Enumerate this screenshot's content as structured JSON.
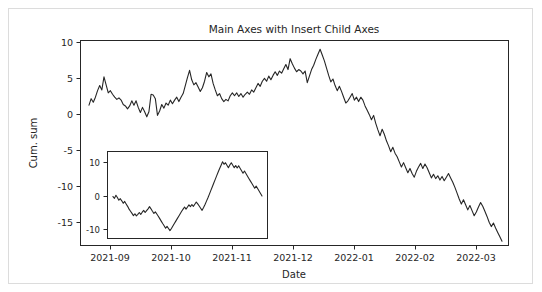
{
  "figure": {
    "background_color": "#ffffff",
    "border_color": "#dcdcdc",
    "line_color": "#262626"
  },
  "chart_data": {
    "type": "line",
    "title": "Main Axes with Insert Child Axes",
    "xlabel": "Date",
    "ylabel": "Cum. sum",
    "grid": false,
    "legend": null,
    "xtick_labels": [
      "2021-09",
      "2021-10",
      "2021-11",
      "2021-12",
      "2022-01",
      "2022-02",
      "2022-03"
    ],
    "ytick_labels": [
      "10",
      "5",
      "0",
      "-5",
      "-10",
      "-15"
    ],
    "ytick_values": [
      10,
      5,
      0,
      -5,
      -10,
      -15
    ],
    "ylim": [
      -17.8,
      10.4
    ],
    "xlim_labels": [
      "2021-08-20",
      "2022-03-22"
    ],
    "series": [
      {
        "name": "Cum. sum",
        "x_start": "2021-08-25",
        "x_end": "2022-03-18",
        "values": [
          1.5,
          2.4,
          1.9,
          2.6,
          3.5,
          4.2,
          3.6,
          5.4,
          4.3,
          3.2,
          3.5,
          3.0,
          2.6,
          2.3,
          2.5,
          2.2,
          1.6,
          1.4,
          1.0,
          1.4,
          2.1,
          1.5,
          2.1,
          1.2,
          0.5,
          1.2,
          0.6,
          -0.1,
          0.6,
          3.0,
          2.9,
          2.4,
          0.1,
          0.7,
          1.6,
          1.1,
          1.8,
          1.5,
          2.2,
          1.7,
          2.2,
          2.6,
          2.0,
          2.6,
          3.1,
          4.2,
          5.3,
          6.3,
          5.0,
          4.3,
          4.6,
          4.0,
          3.4,
          3.9,
          4.8,
          6.0,
          5.4,
          5.8,
          4.5,
          3.6,
          2.8,
          3.1,
          2.4,
          2.0,
          2.3,
          2.1,
          2.8,
          3.2,
          2.8,
          3.2,
          2.7,
          3.1,
          2.6,
          3.0,
          3.3,
          3.0,
          3.6,
          3.3,
          3.9,
          4.5,
          4.1,
          4.8,
          5.2,
          4.8,
          5.5,
          5.0,
          5.6,
          6.1,
          5.6,
          6.2,
          5.9,
          6.5,
          7.1,
          6.4,
          7.9,
          7.2,
          6.6,
          6.1,
          6.4,
          6.2,
          5.8,
          6.2,
          4.6,
          5.5,
          6.4,
          7.0,
          7.8,
          8.5,
          9.2,
          8.4,
          7.6,
          6.6,
          5.6,
          4.7,
          5.1,
          4.2,
          3.5,
          4.1,
          3.4,
          2.6,
          1.8,
          2.1,
          2.6,
          3.1,
          2.2,
          2.6,
          2.0,
          2.6,
          2.2,
          1.4,
          0.8,
          0.2,
          -0.5,
          0.1,
          -1.0,
          -1.9,
          -2.7,
          -1.8,
          -2.5,
          -3.4,
          -4.1,
          -4.9,
          -4.3,
          -5.1,
          -5.6,
          -6.3,
          -7.0,
          -6.4,
          -7.1,
          -7.8,
          -7.2,
          -7.9,
          -8.4,
          -7.6,
          -7.0,
          -6.5,
          -7.2,
          -6.6,
          -7.1,
          -7.8,
          -8.5,
          -8.0,
          -8.6,
          -8.2,
          -8.8,
          -8.3,
          -8.9,
          -8.4,
          -7.9,
          -8.5,
          -9.1,
          -9.8,
          -10.6,
          -11.4,
          -12.1,
          -11.5,
          -12.2,
          -12.9,
          -12.3,
          -13.0,
          -13.7,
          -13.2,
          -12.5,
          -11.9,
          -12.4,
          -13.1,
          -13.8,
          -14.6,
          -15.2,
          -14.7,
          -15.4,
          -16.0,
          -16.6,
          -17.2
        ]
      }
    ]
  },
  "inset_chart_data": {
    "type": "line",
    "title": "",
    "xlabel": "",
    "ylabel": "",
    "grid": false,
    "xtick_labels": [],
    "ytick_labels": [
      "10",
      "0",
      "-10"
    ],
    "ytick_values": [
      10,
      0,
      -10
    ],
    "ylim": [
      -13.5,
      14.5
    ],
    "series": [
      {
        "name": "Cum. sum (zoom)",
        "values": [
          0.0,
          -0.6,
          0.4,
          -0.3,
          -1.2,
          -0.7,
          -1.4,
          -2.2,
          -1.6,
          -2.4,
          -3.2,
          -4.1,
          -4.8,
          -5.5,
          -6.2,
          -5.6,
          -6.3,
          -5.8,
          -5.2,
          -5.8,
          -5.1,
          -4.5,
          -5.2,
          -4.6,
          -4.0,
          -3.3,
          -4.0,
          -4.8,
          -5.5,
          -5.0,
          -5.7,
          -6.4,
          -7.2,
          -8.0,
          -8.8,
          -9.5,
          -10.3,
          -9.7,
          -10.4,
          -11.1,
          -10.4,
          -9.6,
          -8.8,
          -8.0,
          -7.2,
          -6.4,
          -5.6,
          -4.8,
          -4.1,
          -3.4,
          -4.1,
          -3.4,
          -2.7,
          -3.3,
          -2.6,
          -3.2,
          -2.5,
          -1.8,
          -2.4,
          -3.1,
          -3.8,
          -4.5,
          -3.6,
          -2.6,
          -1.5,
          -0.4,
          0.8,
          2.0,
          3.2,
          4.4,
          5.6,
          6.8,
          8.0,
          9.1,
          10.2,
          11.3,
          10.5,
          11.0,
          10.2,
          9.4,
          10.3,
          11.0,
          10.2,
          9.4,
          10.1,
          9.3,
          10.0,
          9.2,
          8.4,
          7.6,
          8.3,
          7.5,
          6.7,
          5.9,
          5.1,
          4.3,
          3.5,
          2.7,
          3.4,
          2.6,
          1.8,
          1.0,
          0.2
        ]
      }
    ]
  }
}
